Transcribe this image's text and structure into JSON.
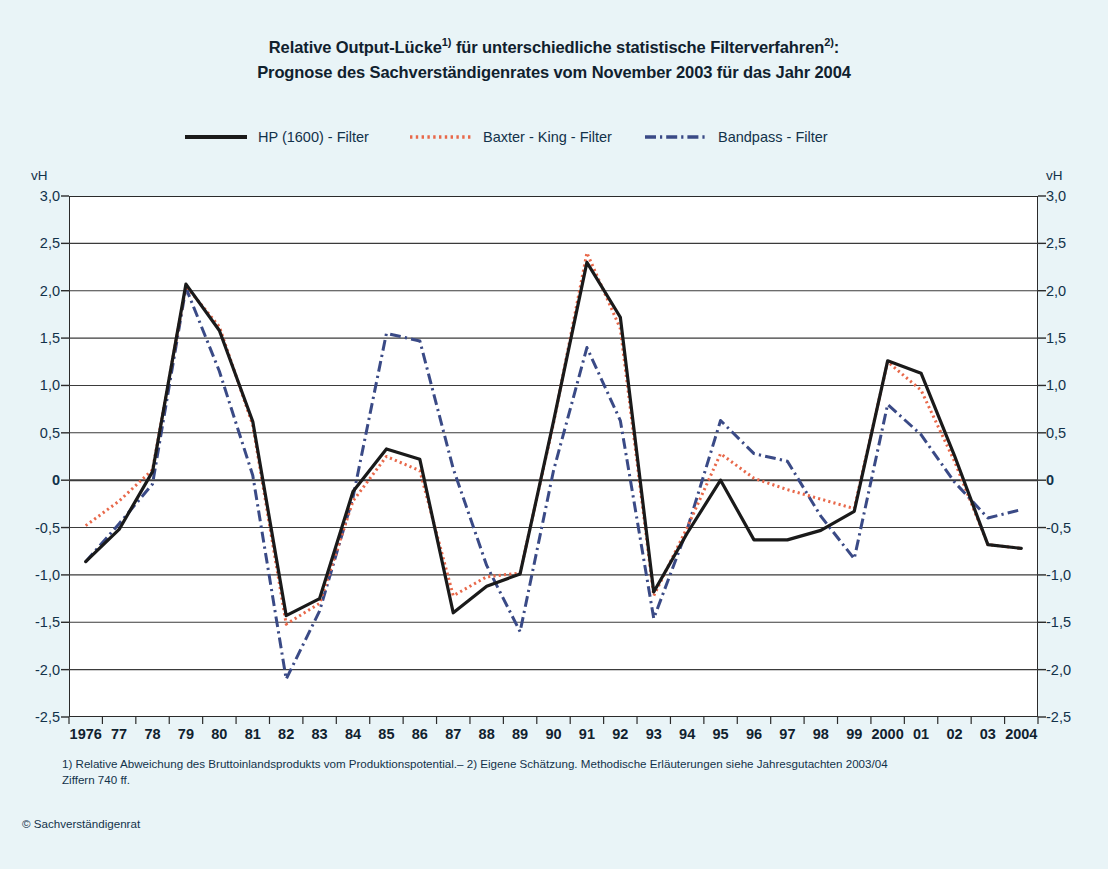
{
  "title": {
    "line1_a": "Relative Output-Lücke",
    "line1_sup1": "1)",
    "line1_b": " für unterschiedliche statistische Filterverfahren",
    "line1_sup2": "2)",
    "line1_c": ":",
    "line2": "Prognose des Sachverständigenrates vom November 2003 für das Jahr 2004"
  },
  "legend": [
    {
      "label": "HP (1600) - Filter",
      "style": "solid",
      "color": "#1a1a1a"
    },
    {
      "label": "Baxter - King - Filter",
      "style": "dotted",
      "color": "#e8684a"
    },
    {
      "label": "Bandpass - Filter",
      "style": "dashdot",
      "color": "#3a4a86"
    }
  ],
  "axes": {
    "unit_left": "vH",
    "unit_right": "vH",
    "y_ticks": [
      "3,0",
      "2,5",
      "2,0",
      "1,5",
      "1,0",
      "0,5",
      "0",
      "-0,5",
      "-1,0",
      "-1,5",
      "-2,0",
      "-2,5"
    ],
    "x_ticks": [
      "1976",
      "77",
      "78",
      "79",
      "80",
      "81",
      "82",
      "83",
      "84",
      "85",
      "86",
      "87",
      "88",
      "89",
      "90",
      "91",
      "92",
      "93",
      "94",
      "95",
      "96",
      "97",
      "98",
      "99",
      "2000",
      "01",
      "02",
      "03",
      "2004"
    ]
  },
  "footnote": {
    "line1": "1) Relative Abweichung des Bruttoinlandsprodukts vom Produktionspotential.– 2) Eigene Schätzung. Methodische Erläuterungen siehe Jahresgutachten 2003/04",
    "line2": "Ziffern 740 ff."
  },
  "copyright": "© Sachverständigenrat",
  "colors": {
    "background": "#e9f4f7",
    "plot_background": "#ffffff",
    "frame": "#2b2b2b",
    "gridline": "#3b3b3b",
    "hp": "#1a1a1a",
    "baxter_king": "#e8684a",
    "bandpass": "#3a4a86"
  },
  "chart_data": {
    "type": "line",
    "title": "Relative Output-Lücke1) für unterschiedliche statistische Filterverfahren2): Prognose des Sachverständigenrates vom November 2003 für das Jahr 2004",
    "xlabel": "",
    "ylabel": "vH",
    "ylim": [
      -2.5,
      3.0
    ],
    "ytick_step": 0.5,
    "grid": true,
    "legend_position": "top",
    "x": [
      1976,
      1977,
      1978,
      1979,
      1980,
      1981,
      1982,
      1983,
      1984,
      1985,
      1986,
      1987,
      1988,
      1989,
      1990,
      1991,
      1992,
      1993,
      1994,
      1995,
      1996,
      1997,
      1998,
      1999,
      2000,
      2001,
      2002,
      2003,
      2004
    ],
    "categories": [
      "1976",
      "77",
      "78",
      "79",
      "80",
      "81",
      "82",
      "83",
      "84",
      "85",
      "86",
      "87",
      "88",
      "89",
      "90",
      "91",
      "92",
      "93",
      "94",
      "95",
      "96",
      "97",
      "98",
      "99",
      "2000",
      "01",
      "02",
      "03",
      "2004"
    ],
    "series": [
      {
        "name": "HP (1600) - Filter",
        "color": "#1a1a1a",
        "style": "solid",
        "values": [
          -0.86,
          -0.52,
          0.09,
          2.07,
          1.58,
          0.62,
          -1.43,
          -1.25,
          -0.12,
          0.33,
          0.22,
          -1.4,
          -1.12,
          -0.99,
          0.62,
          2.3,
          1.72,
          -1.18,
          -0.56,
          0.0,
          -0.63,
          -0.63,
          -0.53,
          -0.33,
          1.26,
          1.13,
          0.26,
          -0.68,
          -0.72
        ]
      },
      {
        "name": "Baxter - King - Filter",
        "color": "#e8684a",
        "style": "dotted",
        "values": [
          -0.48,
          -0.22,
          0.11,
          2.05,
          1.62,
          0.58,
          -1.52,
          -1.3,
          -0.22,
          0.25,
          0.1,
          -1.22,
          -1.02,
          -0.98,
          0.6,
          2.4,
          1.6,
          -1.22,
          -0.5,
          0.28,
          0.02,
          -0.1,
          -0.2,
          -0.3,
          1.25,
          0.95,
          0.2,
          -0.68,
          -0.72
        ]
      },
      {
        "name": "Bandpass - Filter",
        "color": "#3a4a86",
        "style": "dashdot",
        "values": [
          -0.86,
          -0.46,
          -0.04,
          2.03,
          1.15,
          0.05,
          -2.1,
          -1.38,
          -0.18,
          1.55,
          1.47,
          0.12,
          -0.9,
          -1.6,
          0.1,
          1.4,
          0.63,
          -1.46,
          -0.52,
          0.63,
          0.28,
          0.2,
          -0.38,
          -0.83,
          0.8,
          0.48,
          -0.02,
          -0.4,
          -0.31
        ]
      }
    ]
  }
}
